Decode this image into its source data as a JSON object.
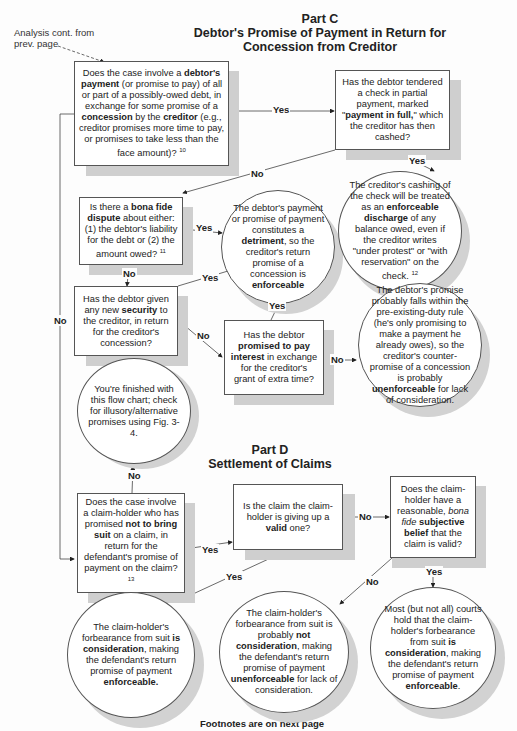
{
  "header": {
    "part_c_label": "Part C",
    "part_c_title_line1": "Debtor's Promise of Payment in Return for",
    "part_c_title_line2": "Concession from Creditor",
    "continuation_note_line1": "Analysis cont. from",
    "continuation_note_line2": "prev. page"
  },
  "part_c": {
    "q_debtor_payment": {
      "pre1": "Does the case involve a ",
      "bold1": "debtor's payment",
      "mid1": " (or promise to pay) of all or part of a possibly-owed debt, in exchange for some promise of a ",
      "bold2": "concession",
      "mid2": " by the ",
      "bold3": "creditor",
      "post": " (e.g., creditor promises more time to pay,  or promises to take less than the face amount)? ",
      "footnote": "10"
    },
    "q_check_tendered": {
      "pre": "Has the debtor tendered a check in partial payment,  marked \"",
      "bold": "payment in full,",
      "post": "\" which the creditor has then cashed?"
    },
    "r_cashing_discharge": {
      "pre": "The creditor's cashing of the check will be treated as an ",
      "bold": "enforceable discharge",
      "post": " of any balance owed, even if the creditor writes \"under protest\" or \"with reservation\" on the check. ",
      "footnote": "12"
    },
    "q_bona_fide_dispute": {
      "pre": "Is there a ",
      "bold": "bona fide dispute",
      "post": " about either: (1) the debtor's liability for the debt or (2) the amount owed? ",
      "footnote": "11"
    },
    "r_detriment": {
      "pre": "The debtor's payment or promise of payment constitutes a ",
      "bold1": "detriment",
      "mid": ", so the creditor's return promise of a concession  is ",
      "bold2": "enforceable"
    },
    "q_new_security": {
      "pre": "Has the debtor given any new ",
      "bold": "security",
      "post": " to the creditor, in return for the creditor's concession?"
    },
    "q_pay_interest": {
      "pre": "Has the debtor ",
      "bold": "promised to pay interest",
      "post": " in exchange for the creditor's grant of extra time?"
    },
    "r_pre_existing_duty": {
      "pre": "The debtor's promise probably  falls within the pre-existing-duty rule (he's only promising to make a payment he already owes), so the creditor's counter-promise of a concession is probably ",
      "bold": "unenforceable",
      "post": " for lack of consideration."
    },
    "r_finished": {
      "text": "You're finished with this flow chart; check for illusory/alternative promises using Fig. 3-4."
    }
  },
  "part_d_header": {
    "label": "Part D",
    "title": "Settlement of Claims"
  },
  "part_d": {
    "q_not_bring_suit": {
      "pre": "Does the case involve a claim-holder who has promised ",
      "bold": "not to bring suit",
      "post": " on a claim, in return for the defendant's promise of payment on the claim?",
      "footnote": "13"
    },
    "q_claim_valid": {
      "pre": "Is the claim the claim-holder is giving up a ",
      "bold": "valid",
      "post": " one?"
    },
    "q_subjective_belief": {
      "pre": "Does the claim-holder have a reasonable, ",
      "italic": "bona fide",
      "mid": " ",
      "bold": "subjective belief",
      "post": " that the claim is valid?"
    },
    "r_is_consideration": {
      "pre": "The claim-holder's forbearance from suit ",
      "bold1": "is consideration",
      "mid": ", making the defendant's return promise of payment ",
      "bold2": "enforceable."
    },
    "r_not_consideration": {
      "pre": "The claim-holder's forbearance from suit is probably ",
      "bold1": "not consideration",
      "mid": ", making the defendant's return promise of payment ",
      "bold2": "unenforceable",
      "post": " for lack of consideration."
    },
    "r_most_courts": {
      "pre": "Most (but not all) courts hold that the claim-holder's forbearance from suit ",
      "bold1": "is consideration",
      "mid": ", making the defendant's return promise of payment ",
      "bold2": "enforceable",
      "post": "."
    }
  },
  "edge_labels": {
    "yes": "Yes",
    "no": "No"
  },
  "footer": {
    "text": "Footnotes are on next page"
  }
}
